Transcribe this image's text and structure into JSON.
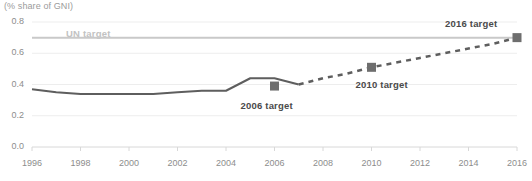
{
  "chart_data": {
    "type": "line",
    "title": "(% share of GNI)",
    "xlabel": "",
    "ylabel": "",
    "ylim": [
      0.0,
      0.8
    ],
    "xlim": [
      1996,
      2016
    ],
    "grid": true,
    "legend": "none",
    "y_ticks": [
      "0.0",
      "0.2",
      "0.4",
      "0.6",
      "0.8"
    ],
    "y_tick_values": [
      0.0,
      0.2,
      0.4,
      0.6,
      0.8
    ],
    "x_ticks": [
      "1996",
      "1998",
      "2000",
      "2002",
      "2004",
      "2006",
      "2008",
      "2010",
      "2012",
      "2014",
      "2016"
    ],
    "x_tick_values": [
      1996,
      1998,
      2000,
      2002,
      2004,
      2006,
      2008,
      2010,
      2012,
      2014,
      2016
    ],
    "series": [
      {
        "name": "Actual",
        "style": "solid",
        "x": [
          1996,
          1997,
          1998,
          1999,
          2000,
          2001,
          2002,
          2003,
          2004,
          2005,
          2006,
          2007
        ],
        "values": [
          0.37,
          0.35,
          0.34,
          0.34,
          0.34,
          0.34,
          0.35,
          0.36,
          0.36,
          0.44,
          0.44,
          0.4
        ]
      },
      {
        "name": "Projection",
        "style": "dashed",
        "x": [
          2007,
          2008,
          2009,
          2010,
          2011,
          2012,
          2013,
          2014,
          2015,
          2016
        ],
        "values": [
          0.4,
          0.44,
          0.47,
          0.51,
          0.54,
          0.57,
          0.6,
          0.63,
          0.66,
          0.7
        ]
      }
    ],
    "reference_line": {
      "label": "UN target",
      "value": 0.7,
      "color": "#c9c9c9"
    },
    "markers": [
      {
        "label": "2006 target",
        "x": 2006,
        "value": 0.39
      },
      {
        "label": "2010 target",
        "x": 2010,
        "value": 0.51
      },
      {
        "label": "2016 target",
        "x": 2016,
        "value": 0.7
      }
    ],
    "colors": {
      "line": "#5e5e5e",
      "marker": "#6e6e6e",
      "grid": "#ededed",
      "text": "#8d8d8d",
      "annotation": "#4a4a4a",
      "reference": "#c9c9c9"
    }
  }
}
